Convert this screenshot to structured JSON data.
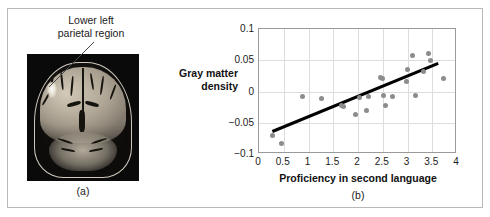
{
  "figure": {
    "border_color": "#b9b9b9",
    "background": "#ffffff"
  },
  "panel_a": {
    "caption": "(a)",
    "annotation_label": "Lower left\nparietal region",
    "image_name": "coronal-mri-brain-scan",
    "image_background": "#0a0a0a",
    "highlight_description": "bright activation blob in lower left parietal region",
    "callout_line": {
      "from_x": 86,
      "from_y": 33,
      "to_x": 41,
      "to_y": 78
    }
  },
  "panel_b": {
    "caption": "(b)",
    "y_axis_title": "Gray matter\ndensity",
    "x_axis_title": "Proficiency in second language"
  },
  "chart_data": {
    "type": "scatter",
    "title": "",
    "xlabel": "Proficiency in second language",
    "ylabel": "Gray matter density",
    "xlim": [
      0,
      4
    ],
    "ylim": [
      -0.1,
      0.1
    ],
    "xticks": [
      "0",
      "0.5",
      "1",
      "1.5",
      "2",
      "2.5",
      "3",
      "3.5",
      "4"
    ],
    "xtick_values": [
      0,
      0.5,
      1,
      1.5,
      2,
      2.5,
      3,
      3.5,
      4
    ],
    "yticks": [
      "0.1",
      "0.05",
      "0",
      "-0.05",
      "-0.1"
    ],
    "ytick_values": [
      0.1,
      0.05,
      0,
      -0.05,
      -0.1
    ],
    "grid": true,
    "legend": null,
    "point_color": "#8c8c8c",
    "point_radius_px": 2.5,
    "trendline": {
      "type": "linear-fit",
      "color": "#000000",
      "width_px": 3,
      "x_start": 0.27,
      "y_start": -0.064,
      "x_end": 3.62,
      "y_end": 0.045
    },
    "points": [
      {
        "x": 0.28,
        "y": -0.071
      },
      {
        "x": 0.46,
        "y": -0.083
      },
      {
        "x": 0.88,
        "y": -0.008
      },
      {
        "x": 1.26,
        "y": -0.011
      },
      {
        "x": 1.66,
        "y": -0.023
      },
      {
        "x": 1.7,
        "y": -0.024
      },
      {
        "x": 1.94,
        "y": -0.037
      },
      {
        "x": 2.04,
        "y": -0.01
      },
      {
        "x": 2.18,
        "y": -0.031
      },
      {
        "x": 2.22,
        "y": -0.008
      },
      {
        "x": 2.46,
        "y": 0.022
      },
      {
        "x": 2.49,
        "y": 0.021
      },
      {
        "x": 2.52,
        "y": -0.007
      },
      {
        "x": 2.56,
        "y": -0.023
      },
      {
        "x": 2.7,
        "y": -0.008
      },
      {
        "x": 2.98,
        "y": 0.016
      },
      {
        "x": 3.01,
        "y": 0.036
      },
      {
        "x": 3.1,
        "y": 0.058
      },
      {
        "x": 3.16,
        "y": -0.007
      },
      {
        "x": 3.32,
        "y": 0.032
      },
      {
        "x": 3.43,
        "y": 0.061
      },
      {
        "x": 3.47,
        "y": 0.049
      },
      {
        "x": 3.73,
        "y": 0.021
      }
    ]
  }
}
